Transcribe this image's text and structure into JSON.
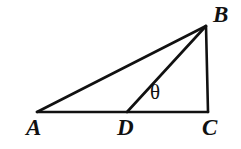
{
  "figure": {
    "type": "geometry-diagram",
    "background_color": "#ffffff",
    "stroke_color": "#111111",
    "stroke_width": 2.6,
    "width": 241,
    "height": 149,
    "points": {
      "A": {
        "label": "A",
        "x": 37,
        "y": 112
      },
      "B": {
        "label": "B",
        "x": 206,
        "y": 26
      },
      "C": {
        "label": "C",
        "x": 208,
        "y": 112
      },
      "D": {
        "label": "D",
        "x": 127,
        "y": 112
      }
    },
    "segments": [
      {
        "name": "AB",
        "from": "A",
        "to": "B"
      },
      {
        "name": "AC",
        "from": "A",
        "to": "C"
      },
      {
        "name": "BC",
        "from": "B",
        "to": "C"
      },
      {
        "name": "DB",
        "from": "D",
        "to": "B"
      }
    ],
    "angle": {
      "symbol": "θ",
      "name": "theta",
      "at_vertex": "D",
      "between": "DB and DC",
      "x": 158,
      "y": 93
    },
    "labels": {
      "A": {
        "text": "A",
        "x": 33,
        "y": 128
      },
      "B": {
        "text": "B",
        "x": 222,
        "y": 15
      },
      "C": {
        "text": "C",
        "x": 210,
        "y": 128
      },
      "D": {
        "text": "D",
        "x": 126,
        "y": 128
      },
      "theta": {
        "text": "θ",
        "x": 158,
        "y": 93
      }
    }
  }
}
